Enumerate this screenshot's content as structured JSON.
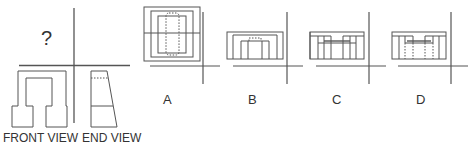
{
  "puzzle": {
    "unknown_view_symbol": "?",
    "given_views": [
      {
        "label": "FRONT VIEW"
      },
      {
        "label": "END VIEW"
      }
    ],
    "options": [
      {
        "letter": "A"
      },
      {
        "letter": "B"
      },
      {
        "letter": "C"
      },
      {
        "letter": "D"
      }
    ]
  },
  "colors": {
    "line": "#555555",
    "text": "#333333",
    "background": "#ffffff"
  }
}
